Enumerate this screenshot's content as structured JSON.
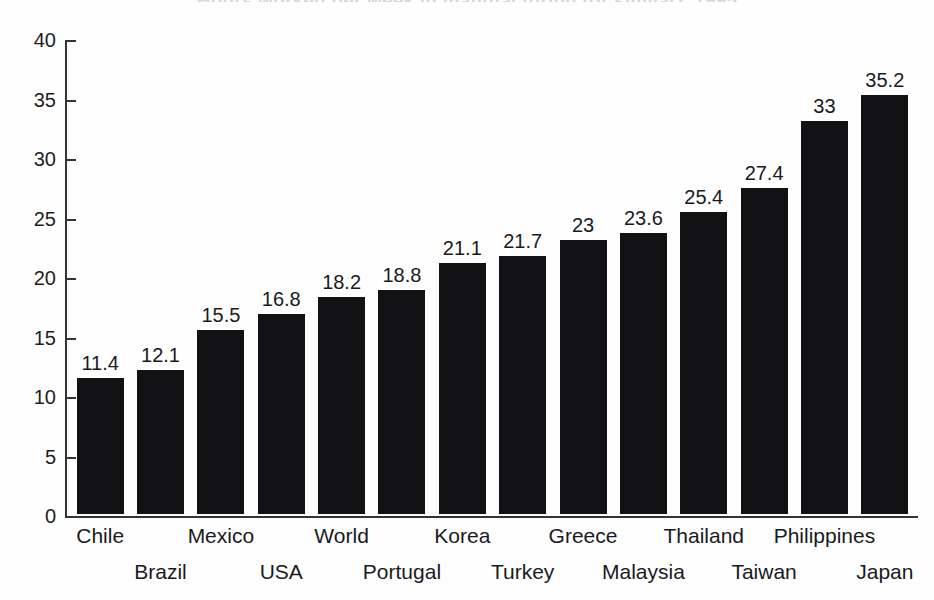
{
  "chart_data": {
    "type": "bar",
    "title": "Hours worked per week in manufacturing (or similar), 1995",
    "subtitle": "",
    "xlabel": "",
    "ylabel": "",
    "ylim": [
      0,
      40
    ],
    "ytick_step": 5,
    "yticks": [
      0,
      5,
      10,
      15,
      20,
      25,
      30,
      35,
      40
    ],
    "ytick_labels": [
      "0",
      "5",
      "10",
      "15",
      "20",
      "25",
      "30",
      "35",
      "40"
    ],
    "grid": false,
    "legend": false,
    "legend_position": "none",
    "bar_color": "#121214",
    "axis_color": "#333338",
    "background_color": "#fefefe",
    "value_labels_shown": true,
    "categories": [
      "Chile",
      "Brazil",
      "Mexico",
      "USA",
      "World",
      "Portugal",
      "Korea",
      "Turkey",
      "Greece",
      "Malaysia",
      "Thailand",
      "Taiwan",
      "Philippines",
      "Japan"
    ],
    "values": [
      11.4,
      12.1,
      15.5,
      16.8,
      18.2,
      18.8,
      21.1,
      21.7,
      23,
      23.6,
      25.4,
      27.4,
      33,
      35.2
    ],
    "value_label_texts": [
      "11.4",
      "12.1",
      "15.5",
      "16.8",
      "18.2",
      "18.8",
      "21.1",
      "21.7",
      "23",
      "23.6",
      "25.4",
      "27.4",
      "33",
      "35.2"
    ],
    "category_label_rows": [
      0,
      1,
      0,
      1,
      0,
      1,
      0,
      1,
      0,
      1,
      0,
      1,
      0,
      1
    ]
  }
}
